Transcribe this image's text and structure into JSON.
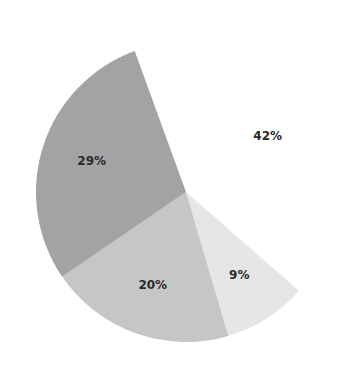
{
  "chart_data": {
    "type": "pie",
    "title": "",
    "start_angle_deg": 340,
    "direction": "clockwise",
    "slices": [
      {
        "label": "42%",
        "value": 42,
        "color": "#ffffff"
      },
      {
        "label": "9%",
        "value": 9,
        "color": "#e6e6e6"
      },
      {
        "label": "20%",
        "value": 20,
        "color": "#c6c6c6"
      },
      {
        "label": "29%",
        "value": 29,
        "color": "#a3a3a3"
      }
    ],
    "legend": "none"
  }
}
